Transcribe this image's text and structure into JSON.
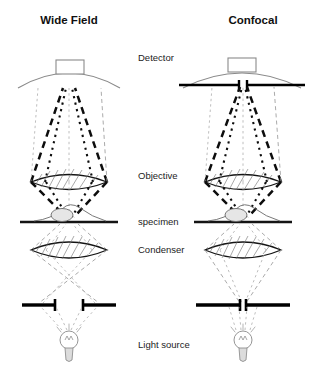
{
  "figure": {
    "kind": "microscopy-comparison-diagram"
  },
  "titles": {
    "left": "Wide Field",
    "right": "Confocal"
  },
  "labels": {
    "detector": "Detector",
    "objective": "Objective",
    "specimen": "specimen",
    "condenser": "Condenser",
    "light_source": "Light source"
  },
  "colors": {
    "background": "#ffffff",
    "text": "#1a1a1a",
    "title": "#101010",
    "emission_ray": "#0d0d0d",
    "illumination_ray": "#9b9b9b",
    "optic_outline": "#141414",
    "dome_outline": "#8a8a8a",
    "lens_hatch": "#6e6e6e",
    "aperture_bar": "#000000",
    "nucleus_fill": "#e6e6e6"
  },
  "columns": [
    {
      "id": "wide-field",
      "title": "Wide Field",
      "detector": {
        "type": "dome-with-housing",
        "pinhole_present": false,
        "pinhole_label": ""
      },
      "objective": {
        "type": "hatched-lens"
      },
      "specimen": {
        "type": "adherent-cell-on-slide"
      },
      "condenser": {
        "type": "hatched-lens"
      },
      "illumination_aperture": {
        "state": "open",
        "state_label": "open aperture"
      },
      "light_source": {
        "type": "lamp-bulb"
      }
    },
    {
      "id": "confocal",
      "title": "Confocal",
      "detector": {
        "type": "dome-with-housing-and-pinhole",
        "pinhole_present": true,
        "pinhole_label": "detection pinhole"
      },
      "objective": {
        "type": "hatched-lens"
      },
      "specimen": {
        "type": "adherent-cell-on-slide"
      },
      "condenser": {
        "type": "hatched-lens"
      },
      "illumination_aperture": {
        "state": "closed",
        "state_label": "closed pinhole aperture"
      },
      "light_source": {
        "type": "lamp-bulb"
      }
    }
  ],
  "icons": {
    "dome": "detector-dome-icon",
    "lens": "lens-icon",
    "slide": "microscope-slide-icon",
    "cell": "cell-icon",
    "bulb": "light-bulb-icon",
    "aperture": "aperture-diaphragm-icon",
    "pinhole": "pinhole-icon"
  }
}
